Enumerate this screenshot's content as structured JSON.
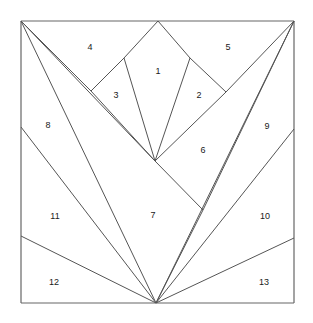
{
  "figure": {
    "background_color": "#ffffff",
    "stroke_color": "#555555",
    "frame_color": "#666666",
    "label_color": "#1a1a1a"
  },
  "frame": {
    "left": 21,
    "top": 21,
    "right": 294,
    "bottom": 303
  },
  "vertices": {
    "top_left": [
      21,
      21
    ],
    "top_apex": [
      158,
      21
    ],
    "top_right": [
      294,
      21
    ],
    "left_mid": [
      21,
      127
    ],
    "left_lower": [
      21,
      236
    ],
    "bottom_left": [
      21,
      303
    ],
    "right_mid": [
      294,
      129
    ],
    "right_lower": [
      294,
      238
    ],
    "bottom_right": [
      294,
      303
    ],
    "v_center": [
      155,
      161
    ],
    "bottom_apex": [
      156,
      303
    ],
    "notch_left": [
      91,
      91
    ],
    "notch_right": [
      226,
      92
    ],
    "crown_left": [
      124,
      58
    ],
    "crown_right": [
      190,
      58
    ],
    "right_spur": [
      203,
      210
    ]
  },
  "edges": [
    {
      "name": "frame-left",
      "from": [
        21,
        21
      ],
      "to": [
        21,
        303
      ]
    },
    {
      "name": "frame-top",
      "from": [
        21,
        21
      ],
      "to": [
        294,
        21
      ]
    },
    {
      "name": "frame-right",
      "from": [
        294,
        21
      ],
      "to": [
        294,
        303
      ]
    },
    {
      "name": "frame-bottom",
      "from": [
        21,
        303
      ],
      "to": [
        294,
        303
      ]
    },
    {
      "name": "top-apex-to-crown-left",
      "from": [
        158,
        21
      ],
      "to": [
        124,
        58
      ]
    },
    {
      "name": "top-apex-to-crown-right",
      "from": [
        158,
        21
      ],
      "to": [
        190,
        58
      ]
    },
    {
      "name": "crown-left-to-notch-left",
      "from": [
        124,
        58
      ],
      "to": [
        91,
        91
      ]
    },
    {
      "name": "crown-right-to-notch-right",
      "from": [
        190,
        58
      ],
      "to": [
        226,
        92
      ]
    },
    {
      "name": "crown-left-to-vcenter",
      "from": [
        124,
        58
      ],
      "to": [
        155,
        161
      ]
    },
    {
      "name": "crown-right-to-vcenter",
      "from": [
        190,
        58
      ],
      "to": [
        155,
        161
      ]
    },
    {
      "name": "notch-left-to-vcenter",
      "from": [
        91,
        91
      ],
      "to": [
        155,
        161
      ]
    },
    {
      "name": "notch-right-to-vcenter",
      "from": [
        226,
        92
      ],
      "to": [
        155,
        161
      ]
    },
    {
      "name": "topleft-to-notch-left",
      "from": [
        21,
        21
      ],
      "to": [
        91,
        91
      ]
    },
    {
      "name": "topright-to-notch-right",
      "from": [
        294,
        21
      ],
      "to": [
        226,
        92
      ]
    },
    {
      "name": "topleft-to-vcenter",
      "from": [
        21,
        21
      ],
      "to": [
        155,
        161
      ]
    },
    {
      "name": "topleft-to-bottom-apex",
      "from": [
        21,
        21
      ],
      "to": [
        156,
        303
      ]
    },
    {
      "name": "topright-to-right-spur",
      "from": [
        294,
        21
      ],
      "to": [
        203,
        210
      ]
    },
    {
      "name": "topright-to-bottom-apex",
      "from": [
        294,
        21
      ],
      "to": [
        156,
        303
      ]
    },
    {
      "name": "vcenter-to-right-spur",
      "from": [
        155,
        161
      ],
      "to": [
        203,
        210
      ]
    },
    {
      "name": "right-spur-to-bottom-apex",
      "from": [
        203,
        210
      ],
      "to": [
        156,
        303
      ]
    },
    {
      "name": "left-mid-to-bottom-apex",
      "from": [
        21,
        127
      ],
      "to": [
        156,
        303
      ]
    },
    {
      "name": "left-lower-to-bottom-apex",
      "from": [
        21,
        236
      ],
      "to": [
        156,
        303
      ]
    },
    {
      "name": "right-mid-to-bottom-apex",
      "from": [
        294,
        129
      ],
      "to": [
        156,
        303
      ]
    },
    {
      "name": "right-lower-to-bottom-apex",
      "from": [
        294,
        238
      ],
      "to": [
        156,
        303
      ]
    }
  ],
  "labels": [
    {
      "id": "1",
      "text": "1",
      "x": 158,
      "y": 72
    },
    {
      "id": "2",
      "text": "2",
      "x": 199,
      "y": 96
    },
    {
      "id": "3",
      "text": "3",
      "x": 116,
      "y": 96
    },
    {
      "id": "4",
      "text": "4",
      "x": 90,
      "y": 48
    },
    {
      "id": "5",
      "text": "5",
      "x": 228,
      "y": 48
    },
    {
      "id": "6",
      "text": "6",
      "x": 203,
      "y": 151
    },
    {
      "id": "7",
      "text": "7",
      "x": 153,
      "y": 216
    },
    {
      "id": "8",
      "text": "8",
      "x": 48,
      "y": 126
    },
    {
      "id": "9",
      "text": "9",
      "x": 267,
      "y": 127
    },
    {
      "id": "10",
      "text": "10",
      "x": 265,
      "y": 217
    },
    {
      "id": "11",
      "text": "11",
      "x": 55,
      "y": 217
    },
    {
      "id": "12",
      "text": "12",
      "x": 54,
      "y": 283
    },
    {
      "id": "13",
      "text": "13",
      "x": 264,
      "y": 283
    }
  ]
}
